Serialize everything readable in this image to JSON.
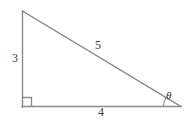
{
  "figure": {
    "type": "right-triangle-diagram",
    "background_color": "#ffffff",
    "stroke_color": "#8a8a8a",
    "label_color": "#3a3a3a",
    "stroke_width": 1.3
  },
  "labels": {
    "vertical_side": "3",
    "hypotenuse": "5",
    "base_side": "4",
    "angle": "θ"
  },
  "geometry": {
    "vertices": {
      "top": {
        "x": 22,
        "y": 11,
        "name": "apex"
      },
      "bottom_left": {
        "x": 22,
        "y": 107,
        "name": "right-angle-vertex"
      },
      "bottom_right": {
        "x": 181,
        "y": 107,
        "name": "theta-vertex"
      }
    },
    "right_angle_marker": {
      "x": 22,
      "y": 107,
      "size": 9
    },
    "angle_arc": {
      "center_x": 181,
      "center_y": 107,
      "radius": 18
    }
  },
  "icons": {
    "right_angle": "right-angle-icon",
    "angle_arc": "angle-arc-icon"
  }
}
